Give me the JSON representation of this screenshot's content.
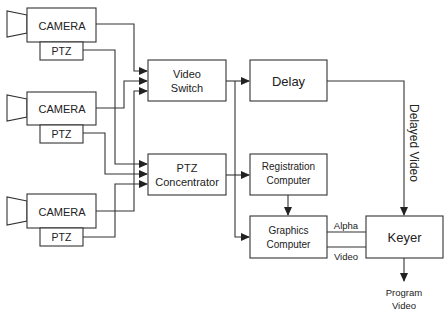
{
  "diagram": {
    "cameras": [
      {
        "label": "CAMERA",
        "ptz_label": "PTZ"
      },
      {
        "label": "CAMERA",
        "ptz_label": "PTZ"
      },
      {
        "label": "CAMERA",
        "ptz_label": "PTZ"
      }
    ],
    "video_switch": {
      "line1": "Video",
      "line2": "Switch"
    },
    "ptz_concentrator": {
      "line1": "PTZ",
      "line2": "Concentrator"
    },
    "delay": {
      "label": "Delay"
    },
    "registration_computer": {
      "line1": "Registration",
      "line2": "Computer"
    },
    "graphics_computer": {
      "line1": "Graphics",
      "line2": "Computer"
    },
    "keyer": {
      "label": "Keyer"
    },
    "edge_labels": {
      "delayed_video": "Delayed Video",
      "alpha": "Alpha",
      "video": "Video",
      "program_line1": "Program",
      "program_line2": "Video"
    },
    "colors": {
      "stroke": "#333333",
      "background": "#ffffff",
      "text": "#222222"
    }
  }
}
